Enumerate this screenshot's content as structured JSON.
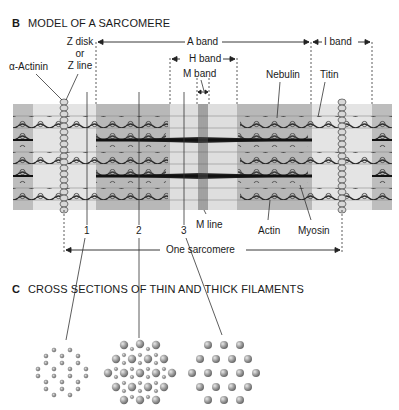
{
  "panel_b": {
    "letter": "B",
    "title": "MODEL OF A SARCOMERE",
    "labels": {
      "z_disk_line1": "Z disk",
      "z_disk_line2": "or",
      "z_disk_line3": "Z line",
      "alpha_actinin": "α-Actinin",
      "a_band": "A band",
      "i_band": "I band",
      "h_band": "H band",
      "m_band": "M band",
      "nebulin": "Nebulin",
      "titin": "Titin",
      "m_line": "M line",
      "actin": "Actin",
      "myosin": "Myosin",
      "one_sarcomere": "One sarcomere",
      "section_1": "1",
      "section_2": "2",
      "section_3": "3"
    }
  },
  "panel_c": {
    "letter": "C",
    "title": "CROSS SECTIONS OF THIN AND THICK FILAMENTS",
    "sections": [
      {
        "id": "1",
        "content": "thin filaments only"
      },
      {
        "id": "2",
        "content": "thin and thick filaments"
      },
      {
        "id": "3",
        "content": "thick filaments only"
      }
    ]
  },
  "colors": {
    "dark_band": "#b8b8b8",
    "light_band": "#e2e2e2",
    "filament": "#333333",
    "bead": "#8a8a8a"
  }
}
